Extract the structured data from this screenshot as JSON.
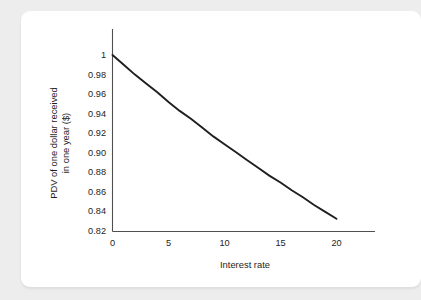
{
  "page": {
    "background_color": "#ededed",
    "card_background": "#ffffff"
  },
  "chart_data": {
    "type": "line",
    "title": "",
    "subtitle": "",
    "xlabel": "Interest rate",
    "ylabel": "PDV of one dollar received in one year ($)",
    "ylabel_line1": "PDV of one dollar received",
    "ylabel_line2": "in one year ($)",
    "xlim": [
      0,
      23
    ],
    "ylim": [
      0.82,
      1.0
    ],
    "grid": false,
    "legend": null,
    "line_color": "#1f1f1f",
    "axis_color": "#4f4f4f",
    "xticks": [
      0,
      5,
      10,
      15,
      20
    ],
    "xtick_labels": [
      "0",
      "5",
      "10",
      "15",
      "20"
    ],
    "yticks": [
      0.82,
      0.84,
      0.86,
      0.88,
      0.9,
      0.92,
      0.94,
      0.96,
      0.98,
      1.0
    ],
    "ytick_labels": [
      "0.82",
      "0.84",
      "0.86",
      "0.88",
      "0.90",
      "0.92",
      "0.94",
      "0.96",
      "0.98",
      "1"
    ],
    "series": [
      {
        "name": "PDV of one dollar received in one year",
        "x": [
          0,
          1,
          2,
          3,
          4,
          5,
          6,
          7,
          8,
          9,
          10,
          11,
          12,
          13,
          14,
          15,
          16,
          17,
          18,
          19,
          20
        ],
        "values": [
          1.0,
          0.99,
          0.98,
          0.971,
          0.962,
          0.952,
          0.943,
          0.935,
          0.926,
          0.917,
          0.909,
          0.901,
          0.893,
          0.885,
          0.877,
          0.87,
          0.862,
          0.855,
          0.847,
          0.84,
          0.833
        ]
      }
    ]
  }
}
